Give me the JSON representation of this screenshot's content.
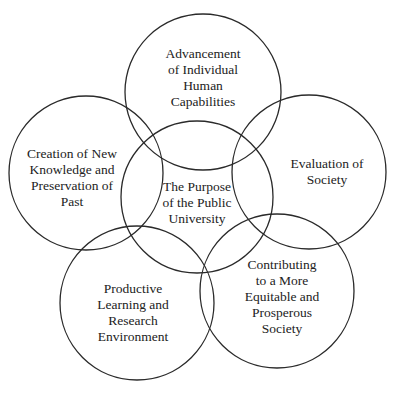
{
  "diagram": {
    "stroke_color": "#2a2a2a",
    "background": "#ffffff",
    "circles": [
      {
        "id": "top",
        "cx": 203,
        "cy": 92,
        "r": 78,
        "lines": [
          "Advancement",
          "of Individual",
          "Human",
          "Capabilities"
        ],
        "tx": 203,
        "ty": 78
      },
      {
        "id": "left",
        "cx": 86,
        "cy": 173,
        "r": 77,
        "lines": [
          "Creation of New",
          "Knowledge and",
          "Preservation of",
          "Past"
        ],
        "tx": 72,
        "ty": 178
      },
      {
        "id": "right",
        "cx": 309,
        "cy": 172,
        "r": 77,
        "lines": [
          "Evaluation of",
          "Society"
        ],
        "tx": 327,
        "ty": 172
      },
      {
        "id": "center",
        "cx": 197,
        "cy": 197,
        "r": 76,
        "lines": [
          "The Purpose",
          "of the Public",
          "University"
        ],
        "tx": 197,
        "ty": 203
      },
      {
        "id": "bottom-left",
        "cx": 137,
        "cy": 303,
        "r": 77,
        "lines": [
          "Productive",
          "Learning and",
          "Research",
          "Environment"
        ],
        "tx": 133,
        "ty": 313
      },
      {
        "id": "bottom-right",
        "cx": 277,
        "cy": 291,
        "r": 77,
        "lines": [
          "Contributing",
          "to a More",
          "Equitable and",
          "Prosperous",
          "Society"
        ],
        "tx": 282,
        "ty": 297
      }
    ]
  }
}
